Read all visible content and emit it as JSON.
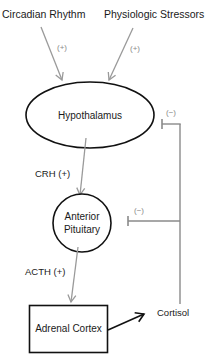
{
  "diagram": {
    "colors": {
      "node_stroke": "#111111",
      "stimulatory_arrow": "#9a9a9a",
      "feedback_line": "#8a8a8a",
      "output_arrow": "#111111",
      "sign_label": "#8a8a8a",
      "text": "#1a1a1a"
    },
    "inputs": [
      {
        "label": "Circadian Rhythm",
        "sign": "(+)"
      },
      {
        "label": "Physiologic Stressors",
        "sign": "(+)"
      }
    ],
    "nodes": {
      "hypothalamus": {
        "label": "Hypothalamus",
        "shape": "ellipse"
      },
      "pituitary": {
        "label_line1": "Anterior",
        "label_line2": "Pituitary",
        "shape": "circle"
      },
      "adrenal": {
        "label": "Adrenal Cortex",
        "shape": "rectangle"
      },
      "cortisol": {
        "label": "Cortisol",
        "shape": "text"
      }
    },
    "edges": {
      "crh": {
        "label": "CRH (+)",
        "from": "Hypothalamus",
        "to": "Anterior Pituitary"
      },
      "acth": {
        "label": "ACTH (+)",
        "from": "Anterior Pituitary",
        "to": "Adrenal Cortex"
      },
      "output": {
        "from": "Adrenal Cortex",
        "to": "Cortisol"
      }
    },
    "feedback": [
      {
        "target": "Hypothalamus",
        "sign": "(−)"
      },
      {
        "target": "Anterior Pituitary",
        "sign": "(−)"
      }
    ]
  }
}
